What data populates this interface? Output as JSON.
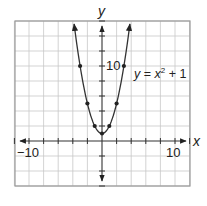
{
  "chart_data": {
    "type": "line",
    "title": "",
    "xlabel": "y",
    "ylabel": "y",
    "x_axis_label": "x",
    "y_axis_label": "y",
    "xlim": [
      -12,
      12
    ],
    "ylim": [
      -6,
      16
    ],
    "grid": true,
    "grid_step": 2,
    "x_tick_labels": [
      {
        "value": -10,
        "label": "−10"
      },
      {
        "value": 10,
        "label": "10"
      }
    ],
    "y_tick_labels": [
      {
        "value": 10,
        "label": "10"
      }
    ],
    "series": [
      {
        "name": "y = x² + 1",
        "equation": "y = x^2 + 1",
        "points": [
          {
            "x": -3,
            "y": 10
          },
          {
            "x": -2,
            "y": 5
          },
          {
            "x": -1,
            "y": 2
          },
          {
            "x": 0,
            "y": 1
          },
          {
            "x": 1,
            "y": 2
          },
          {
            "x": 2,
            "y": 5
          },
          {
            "x": 3,
            "y": 10
          }
        ]
      }
    ],
    "annotations": [
      {
        "text": "y = x² + 1",
        "x": 9,
        "y": 10
      }
    ]
  },
  "labels": {
    "x_axis": "x",
    "y_axis": "y",
    "x_neg": "−10",
    "x_pos": "10",
    "y_pos": "10",
    "eq_y": "y",
    "eq_eq": " = ",
    "eq_x": "x",
    "eq_exp": "2",
    "eq_rest": " + 1"
  },
  "colors": {
    "grid": "#c8c8c8",
    "frame": "#9a9a9a",
    "ink": "#222222"
  }
}
